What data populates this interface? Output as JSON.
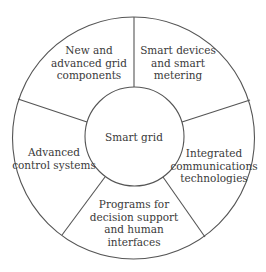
{
  "diagram": {
    "type": "segmented-ring",
    "center": {
      "label": "Smart grid"
    },
    "segments": [
      {
        "lines": [
          "New and",
          "advanced grid",
          "components"
        ]
      },
      {
        "lines": [
          "Smart devices",
          "and smart",
          "metering"
        ]
      },
      {
        "lines": [
          "Integrated",
          "communications",
          "technologies"
        ]
      },
      {
        "lines": [
          "Programs for",
          "decision support",
          "and human",
          "interfaces"
        ]
      },
      {
        "lines": [
          "Advanced",
          "control systems"
        ]
      }
    ],
    "colors": {
      "stroke": "#555555",
      "text": "#3a3a3a",
      "background": "#ffffff"
    }
  }
}
